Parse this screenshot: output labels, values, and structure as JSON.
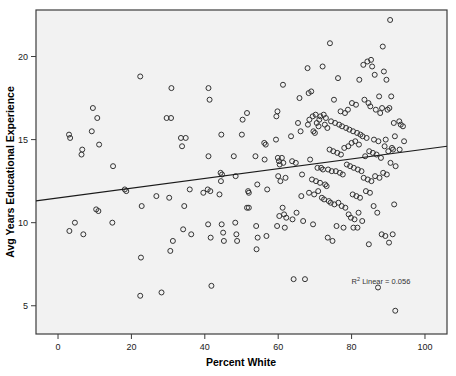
{
  "chart_data": {
    "type": "scatter",
    "title": "",
    "xlabel": "Percent White",
    "ylabel": "Avg Years Educational Experience",
    "xlim": [
      -6,
      106
    ],
    "ylim": [
      3.3,
      22.8
    ],
    "xticks": [
      0,
      20,
      40,
      60,
      80,
      100
    ],
    "yticks": [
      5,
      10,
      15,
      20
    ],
    "xtick_labels": [
      "0",
      "20",
      "40",
      "60",
      "80",
      "100"
    ],
    "ytick_labels": [
      "5",
      "10",
      "15",
      "20"
    ],
    "grid": false,
    "legend": false,
    "marker": "open-circle",
    "marker_color": "#333333",
    "annotations": [
      {
        "name": "r2-annotation",
        "text": "R² Linear = 0.056",
        "sup_base": "R",
        "sup_text": "2",
        "sup_rest": " Linear = 0.056",
        "x": 88,
        "y": 6.3
      }
    ],
    "fit_line": {
      "name": "linear-regression-line",
      "type": "linear",
      "r_squared": 0.056,
      "x_start": -6,
      "y_start": 11.31,
      "x_end": 106,
      "y_end": 14.6,
      "color": "#1a1a1a"
    },
    "points": [
      [
        3.0,
        15.3
      ],
      [
        3.3,
        15.1
      ],
      [
        3.1,
        9.5
      ],
      [
        4.6,
        10.0
      ],
      [
        6.6,
        14.4
      ],
      [
        6.4,
        14.1
      ],
      [
        6.9,
        9.3
      ],
      [
        9.5,
        16.9
      ],
      [
        9.2,
        15.5
      ],
      [
        10.7,
        16.3
      ],
      [
        11.2,
        14.7
      ],
      [
        10.4,
        10.8
      ],
      [
        11.0,
        10.7
      ],
      [
        14.8,
        10.0
      ],
      [
        15.0,
        13.4
      ],
      [
        18.2,
        12.0
      ],
      [
        18.6,
        11.9
      ],
      [
        22.4,
        18.8
      ],
      [
        22.8,
        11.0
      ],
      [
        22.6,
        7.9
      ],
      [
        22.4,
        5.6
      ],
      [
        26.8,
        11.6
      ],
      [
        28.2,
        5.8
      ],
      [
        29.6,
        16.3
      ],
      [
        30.8,
        16.3
      ],
      [
        30.9,
        18.1
      ],
      [
        30.3,
        11.5
      ],
      [
        30.6,
        8.3
      ],
      [
        31.3,
        8.9
      ],
      [
        33.5,
        15.1
      ],
      [
        34.8,
        15.1
      ],
      [
        33.8,
        14.6
      ],
      [
        34.4,
        11.0
      ],
      [
        34.1,
        9.6
      ],
      [
        35.9,
        12.0
      ],
      [
        36.3,
        9.3
      ],
      [
        39.6,
        11.8
      ],
      [
        41.0,
        18.1
      ],
      [
        41.3,
        17.4
      ],
      [
        41.0,
        14.0
      ],
      [
        40.8,
        12.0
      ],
      [
        41.5,
        11.9
      ],
      [
        40.9,
        9.9
      ],
      [
        41.6,
        9.1
      ],
      [
        41.8,
        6.2
      ],
      [
        44.5,
        15.3
      ],
      [
        44.3,
        13.0
      ],
      [
        44.7,
        12.9
      ],
      [
        44.4,
        12.5
      ],
      [
        44.0,
        11.7
      ],
      [
        44.6,
        9.9
      ],
      [
        45.0,
        9.4
      ],
      [
        45.2,
        8.9
      ],
      [
        47.9,
        14.0
      ],
      [
        48.4,
        12.8
      ],
      [
        48.3,
        10.0
      ],
      [
        48.6,
        9.3
      ],
      [
        48.8,
        8.9
      ],
      [
        50.3,
        16.2
      ],
      [
        50.1,
        15.3
      ],
      [
        51.5,
        16.6
      ],
      [
        51.8,
        11.9
      ],
      [
        52.0,
        11.8
      ],
      [
        51.5,
        10.9
      ],
      [
        52.0,
        10.9
      ],
      [
        53.8,
        14.0
      ],
      [
        54.3,
        12.3
      ],
      [
        54.0,
        9.8
      ],
      [
        54.4,
        9.1
      ],
      [
        54.1,
        8.4
      ],
      [
        56.2,
        14.8
      ],
      [
        56.6,
        14.7
      ],
      [
        56.3,
        13.8
      ],
      [
        57.0,
        12.0
      ],
      [
        56.8,
        9.2
      ],
      [
        59.5,
        16.4
      ],
      [
        59.8,
        16.7
      ],
      [
        59.4,
        15.0
      ],
      [
        59.9,
        13.9
      ],
      [
        60.2,
        13.7
      ],
      [
        60.4,
        13.5
      ],
      [
        60.0,
        12.8
      ],
      [
        60.6,
        12.5
      ],
      [
        60.3,
        10.4
      ],
      [
        59.7,
        9.8
      ],
      [
        61.3,
        18.3
      ],
      [
        61.0,
        13.9
      ],
      [
        61.4,
        13.6
      ],
      [
        61.2,
        10.9
      ],
      [
        61.6,
        10.5
      ],
      [
        62.0,
        12.7
      ],
      [
        62.2,
        10.3
      ],
      [
        61.8,
        9.7
      ],
      [
        63.5,
        15.2
      ],
      [
        63.8,
        13.7
      ],
      [
        63.9,
        10.2
      ],
      [
        64.2,
        6.6
      ],
      [
        64.8,
        13.6
      ],
      [
        65.0,
        10.6
      ],
      [
        65.4,
        16.0
      ],
      [
        65.8,
        17.5
      ],
      [
        66.1,
        15.5
      ],
      [
        66.5,
        12.9
      ],
      [
        66.3,
        11.6
      ],
      [
        66.8,
        10.1
      ],
      [
        67.3,
        6.6
      ],
      [
        68.0,
        19.3
      ],
      [
        68.3,
        17.8
      ],
      [
        68.5,
        16.2
      ],
      [
        68.1,
        15.9
      ],
      [
        68.7,
        13.8
      ],
      [
        68.4,
        11.8
      ],
      [
        69.0,
        17.9
      ],
      [
        69.4,
        16.4
      ],
      [
        69.6,
        15.5
      ],
      [
        69.2,
        12.6
      ],
      [
        69.8,
        11.7
      ],
      [
        69.5,
        9.9
      ],
      [
        70.2,
        16.5
      ],
      [
        70.5,
        16.0
      ],
      [
        70.0,
        15.4
      ],
      [
        70.7,
        13.3
      ],
      [
        70.3,
        12.5
      ],
      [
        70.9,
        11.9
      ],
      [
        71.2,
        16.2
      ],
      [
        71.5,
        16.4
      ],
      [
        71.0,
        15.8
      ],
      [
        71.7,
        13.3
      ],
      [
        71.4,
        12.4
      ],
      [
        71.9,
        11.5
      ],
      [
        72.1,
        19.4
      ],
      [
        72.4,
        16.5
      ],
      [
        72.7,
        15.9
      ],
      [
        72.2,
        13.2
      ],
      [
        72.8,
        12.3
      ],
      [
        72.5,
        11.4
      ],
      [
        73.0,
        16.3
      ],
      [
        73.4,
        15.7
      ],
      [
        73.6,
        13.2
      ],
      [
        73.2,
        12.2
      ],
      [
        73.8,
        11.3
      ],
      [
        73.5,
        9.1
      ],
      [
        74.1,
        20.8
      ],
      [
        74.4,
        16.1
      ],
      [
        74.0,
        14.4
      ],
      [
        74.6,
        13.1
      ],
      [
        74.3,
        11.2
      ],
      [
        74.8,
        8.9
      ],
      [
        75.2,
        17.4
      ],
      [
        75.5,
        16.0
      ],
      [
        75.0,
        14.3
      ],
      [
        75.7,
        13.1
      ],
      [
        75.3,
        11.1
      ],
      [
        75.9,
        9.8
      ],
      [
        76.3,
        18.7
      ],
      [
        76.6,
        15.9
      ],
      [
        76.1,
        14.2
      ],
      [
        76.8,
        13.0
      ],
      [
        76.4,
        11.2
      ],
      [
        77.0,
        16.7
      ],
      [
        77.4,
        15.8
      ],
      [
        77.1,
        14.1
      ],
      [
        77.6,
        12.9
      ],
      [
        77.3,
        11.0
      ],
      [
        77.8,
        9.7
      ],
      [
        78.2,
        16.6
      ],
      [
        78.5,
        15.7
      ],
      [
        78.0,
        14.5
      ],
      [
        78.7,
        13.5
      ],
      [
        78.3,
        10.9
      ],
      [
        79.0,
        16.8
      ],
      [
        79.4,
        15.6
      ],
      [
        79.1,
        14.6
      ],
      [
        79.6,
        13.4
      ],
      [
        79.2,
        10.5
      ],
      [
        79.8,
        10.3
      ],
      [
        80.1,
        17.2
      ],
      [
        80.4,
        15.5
      ],
      [
        80.0,
        14.8
      ],
      [
        80.6,
        13.3
      ],
      [
        80.3,
        11.7
      ],
      [
        80.8,
        10.2
      ],
      [
        80.5,
        9.7
      ],
      [
        81.2,
        17.1
      ],
      [
        81.5,
        15.4
      ],
      [
        81.0,
        14.9
      ],
      [
        81.7,
        13.2
      ],
      [
        81.3,
        11.6
      ],
      [
        81.9,
        10.6
      ],
      [
        81.6,
        9.7
      ],
      [
        82.1,
        18.6
      ],
      [
        82.4,
        15.3
      ],
      [
        82.0,
        14.7
      ],
      [
        82.7,
        13.1
      ],
      [
        82.3,
        11.5
      ],
      [
        82.9,
        10.1
      ],
      [
        83.2,
        19.5
      ],
      [
        83.5,
        17.4
      ],
      [
        83.0,
        15.2
      ],
      [
        83.7,
        14.0
      ],
      [
        83.3,
        12.7
      ],
      [
        83.9,
        11.9
      ],
      [
        84.3,
        19.7
      ],
      [
        84.6,
        17.2
      ],
      [
        84.1,
        15.1
      ],
      [
        84.8,
        14.3
      ],
      [
        84.4,
        12.6
      ],
      [
        85.0,
        11.8
      ],
      [
        84.7,
        8.7
      ],
      [
        85.3,
        19.8
      ],
      [
        85.6,
        19.4
      ],
      [
        85.1,
        17.0
      ],
      [
        85.8,
        14.2
      ],
      [
        85.4,
        12.5
      ],
      [
        86.0,
        11.0
      ],
      [
        86.3,
        18.9
      ],
      [
        86.6,
        16.8
      ],
      [
        86.1,
        15.0
      ],
      [
        86.8,
        14.1
      ],
      [
        86.4,
        12.8
      ],
      [
        87.0,
        10.6
      ],
      [
        87.2,
        6.1
      ],
      [
        87.5,
        17.6
      ],
      [
        87.8,
        16.6
      ],
      [
        87.3,
        14.9
      ],
      [
        88.0,
        13.9
      ],
      [
        87.6,
        12.7
      ],
      [
        88.2,
        9.3
      ],
      [
        88.5,
        20.6
      ],
      [
        88.8,
        19.1
      ],
      [
        88.3,
        16.9
      ],
      [
        89.0,
        14.6
      ],
      [
        88.6,
        13.0
      ],
      [
        89.2,
        9.2
      ],
      [
        89.5,
        18.6
      ],
      [
        89.8,
        16.8
      ],
      [
        89.3,
        15.0
      ],
      [
        90.0,
        14.3
      ],
      [
        89.6,
        12.9
      ],
      [
        90.2,
        8.8
      ],
      [
        90.5,
        22.2
      ],
      [
        90.8,
        17.6
      ],
      [
        90.3,
        16.9
      ],
      [
        91.0,
        14.5
      ],
      [
        90.6,
        13.6
      ],
      [
        91.2,
        9.3
      ],
      [
        91.5,
        16.0
      ],
      [
        91.8,
        15.2
      ],
      [
        91.3,
        14.4
      ],
      [
        92.0,
        13.4
      ],
      [
        91.6,
        11.1
      ],
      [
        91.9,
        4.7
      ],
      [
        93.0,
        16.1
      ],
      [
        93.4,
        15.9
      ],
      [
        93.1,
        14.4
      ],
      [
        94.0,
        15.8
      ],
      [
        94.3,
        14.9
      ]
    ]
  }
}
